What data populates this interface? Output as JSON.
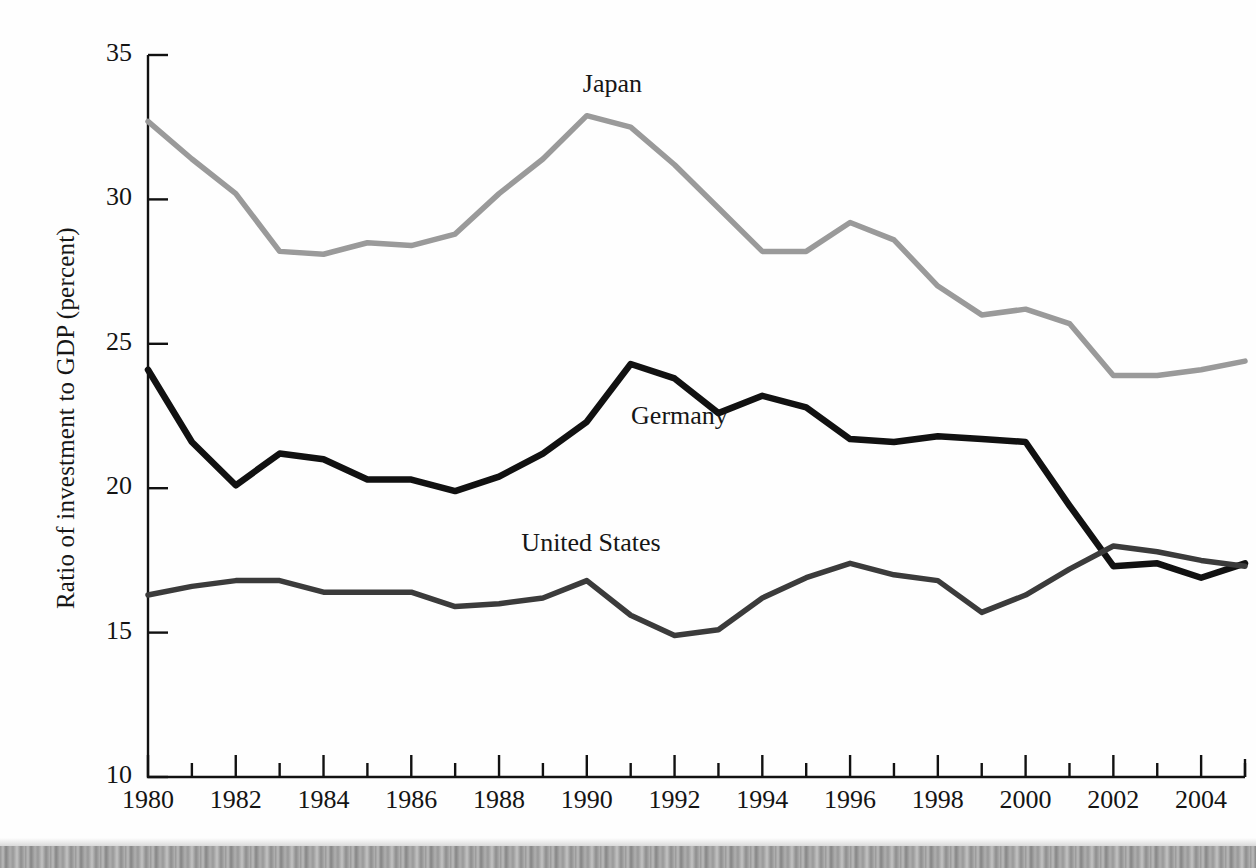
{
  "chart_data": {
    "type": "line",
    "title": "",
    "subtitle": "",
    "xlabel": "",
    "ylabel": "Ratio of investment to GDP (percent)",
    "xlim": [
      1980,
      2005
    ],
    "ylim": [
      10,
      35
    ],
    "ytick_values": [
      10,
      15,
      20,
      25,
      30,
      35
    ],
    "ytick_labels": [
      "10",
      "15",
      "20",
      "25",
      "30",
      "35"
    ],
    "xtick_values": [
      1980,
      1981,
      1982,
      1983,
      1984,
      1985,
      1986,
      1987,
      1988,
      1989,
      1990,
      1991,
      1992,
      1993,
      1994,
      1995,
      1996,
      1997,
      1998,
      1999,
      2000,
      2001,
      2002,
      2003,
      2004,
      2005
    ],
    "xtick_labeled": [
      1980,
      1982,
      1984,
      1986,
      1988,
      1990,
      1992,
      1994,
      1996,
      1998,
      2000,
      2002,
      2004
    ],
    "xtick_labels": [
      "1980",
      "1982",
      "1984",
      "1986",
      "1988",
      "1990",
      "1992",
      "1994",
      "1996",
      "1998",
      "2000",
      "2002",
      "2004"
    ],
    "grid": false,
    "legend_position": "inline-labels",
    "x": [
      1980,
      1981,
      1982,
      1983,
      1984,
      1985,
      1986,
      1987,
      1988,
      1989,
      1990,
      1991,
      1992,
      1993,
      1994,
      1995,
      1996,
      1997,
      1998,
      1999,
      2000,
      2001,
      2002,
      2003,
      2004,
      2005
    ],
    "series": [
      {
        "name": "Japan",
        "color": "#9a9a9a",
        "width": 5.5,
        "label_x": 1990,
        "label_y": 33.9,
        "values": [
          32.7,
          31.4,
          30.2,
          28.2,
          28.1,
          28.5,
          28.4,
          28.8,
          30.2,
          31.4,
          32.9,
          32.5,
          31.2,
          29.7,
          28.2,
          28.2,
          29.2,
          28.6,
          27.0,
          26.0,
          26.2,
          25.7,
          23.9,
          23.9,
          24.1,
          24.4
        ]
      },
      {
        "name": "Germany",
        "color": "#111111",
        "width": 6.5,
        "label_x": 1991.1,
        "label_y": 22.4,
        "values": [
          24.1,
          21.6,
          20.1,
          21.2,
          21.0,
          20.3,
          20.3,
          19.9,
          20.4,
          21.2,
          22.3,
          24.3,
          23.8,
          22.6,
          23.2,
          22.8,
          21.7,
          21.6,
          21.8,
          21.7,
          21.6,
          19.4,
          17.3,
          17.4,
          16.9,
          17.4
        ]
      },
      {
        "name": "United States",
        "color": "#3b3b3b",
        "width": 5.5,
        "label_x": 1988.6,
        "label_y": 18.0,
        "values": [
          16.3,
          16.6,
          16.8,
          16.8,
          16.4,
          16.4,
          16.4,
          15.9,
          16.0,
          16.2,
          16.8,
          15.6,
          14.9,
          15.1,
          16.2,
          16.9,
          17.4,
          17.0,
          16.8,
          15.7,
          16.3,
          17.2,
          18.0,
          17.8,
          17.5,
          17.3
        ]
      }
    ]
  },
  "figure": {
    "background_color": "#fefefe",
    "axis_color": "#111111",
    "scan_artifact": "bottom-scan-band"
  }
}
